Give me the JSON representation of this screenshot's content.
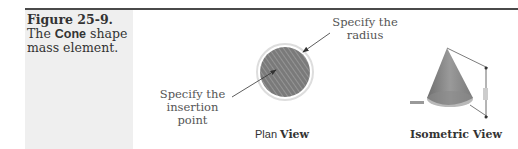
{
  "figure": {
    "number": "Figure 25-9.",
    "caption_pre": "The ",
    "caption_bold": "Cone",
    "caption_post": " shape mass element."
  },
  "plan_view": {
    "callout_radius_line1": "Specify the",
    "callout_radius_line2": "radius",
    "callout_insertion_line1": "Specify the",
    "callout_insertion_line2": "insertion point",
    "title_plain": "Plan ",
    "title_bold": "View"
  },
  "isometric_view": {
    "title": "Isometric View"
  },
  "colors": {
    "rule": "#4a4a4a",
    "caption_bg": "#efefef",
    "cone_fill": "#8a8a8a"
  }
}
